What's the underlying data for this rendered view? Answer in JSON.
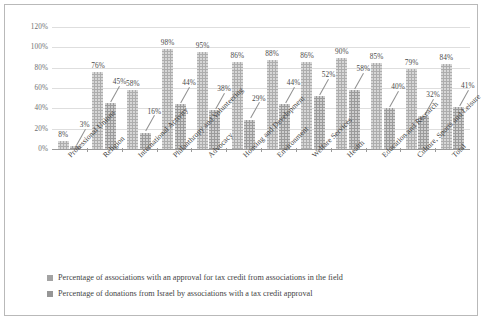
{
  "chart_data": {
    "type": "bar",
    "title": "",
    "subtitle": "",
    "xlabel": "",
    "ylabel": "",
    "ylim": [
      0,
      120
    ],
    "ytick_labels": [
      "0%",
      "20%",
      "40%",
      "60%",
      "80%",
      "100%",
      "120%"
    ],
    "ytick_values": [
      0,
      20,
      40,
      60,
      80,
      100,
      120
    ],
    "grid": true,
    "legend_position": "bottom-left",
    "categories": [
      "Professional Unions",
      "Religion",
      "International Activity",
      "Philanthropy and Volunteering",
      "Advocacy",
      "Housing and Development",
      "Environment",
      "Welfare Services",
      "Health",
      "Education and Research",
      "Culture, Sports and Leisure",
      "Total"
    ],
    "series": [
      {
        "name": "Percentage of associations with an approval for tax credit from associations in the field",
        "values": [
          8,
          76,
          58,
          98,
          95,
          86,
          88,
          86,
          90,
          85,
          79,
          84
        ],
        "labels": [
          "8%",
          "76%",
          "58%",
          "98%",
          "95%",
          "86%",
          "88%",
          "86%",
          "90%",
          "85%",
          "79%",
          "84%"
        ],
        "color": "#adadad"
      },
      {
        "name": "Percentage of donations from Israel by associations with a tax credit approval",
        "values": [
          3,
          45,
          16,
          44,
          38,
          29,
          44,
          52,
          58,
          40,
          32,
          41
        ],
        "labels": [
          "3%",
          "45%",
          "16%",
          "44%",
          "38%",
          "29%",
          "44%",
          "52%",
          "58%",
          "40%",
          "32%",
          "41%"
        ],
        "color": "#9b9b9b"
      }
    ]
  }
}
